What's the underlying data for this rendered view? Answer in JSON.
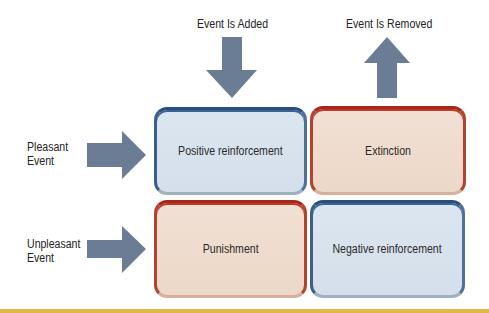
{
  "diagram": {
    "columns": [
      {
        "label": "Event Is Added",
        "arrow": "down-arrow"
      },
      {
        "label": "Event Is Removed",
        "arrow": "up-arrow"
      }
    ],
    "rows": [
      {
        "label_line1": "Pleasant",
        "label_line2": "Event",
        "arrow": "right-arrow"
      },
      {
        "label_line1": "Unpleasant",
        "label_line2": "Event",
        "arrow": "right-arrow"
      }
    ],
    "cells": [
      {
        "text": "Positive reinforcement",
        "tone": "blue"
      },
      {
        "text": "Extinction",
        "tone": "red"
      },
      {
        "text": "Punishment",
        "tone": "red"
      },
      {
        "text": "Negative reinforcement",
        "tone": "blue"
      }
    ]
  },
  "colors": {
    "arrow": "#6b7d94",
    "blue_border": "#284f7a",
    "blue_fill": "#dce6f0",
    "red_border": "#a8261a",
    "red_fill": "#f1e0d4",
    "accent_line": "#e3b64a"
  }
}
